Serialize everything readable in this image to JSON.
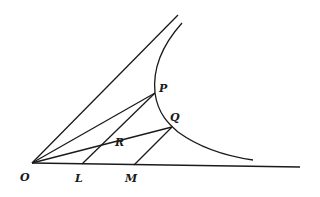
{
  "diagram": {
    "points": {
      "O": {
        "label": "O",
        "x": 32,
        "y": 163
      },
      "L": {
        "label": "L",
        "x": 82,
        "y": 164
      },
      "M": {
        "label": "M",
        "x": 134,
        "y": 165
      },
      "P": {
        "label": "P",
        "x": 155,
        "y": 93
      },
      "Q": {
        "label": "Q",
        "x": 172,
        "y": 127
      },
      "R": {
        "label": "R",
        "x": 97,
        "y": 147
      }
    },
    "labels": {
      "O": "O",
      "L": "L",
      "M": "M",
      "P": "P",
      "Q": "Q",
      "R": "R"
    },
    "colors": {
      "ink": "#1a1a1a",
      "background": "#ffffff"
    }
  }
}
